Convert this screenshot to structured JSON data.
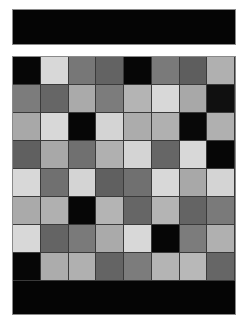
{
  "top_bar": {},
  "board": {
    "rows": 8,
    "cols": 8,
    "cells": [
      [
        "#060606",
        "#d8d8d8",
        "#777777",
        "#636363",
        "#060606",
        "#7a7a7a",
        "#5e5e5e",
        "#b0b0b0"
      ],
      [
        "#7c7c7c",
        "#666666",
        "#aaaaaa",
        "#7c7c7c",
        "#b4b4b4",
        "#d8d8d8",
        "#a8a8a8",
        "#101010"
      ],
      [
        "#a8a8a8",
        "#d8d8d8",
        "#060606",
        "#d4d4d4",
        "#acacac",
        "#b0b0b0",
        "#080808",
        "#b0b0b0"
      ],
      [
        "#606060",
        "#a8a8a8",
        "#707070",
        "#b0b0b0",
        "#d4d4d4",
        "#666666",
        "#d8d8d8",
        "#060606"
      ],
      [
        "#d8d8d8",
        "#707070",
        "#d4d4d4",
        "#606060",
        "#707070",
        "#d8d8d8",
        "#a8a8a8",
        "#d4d4d4"
      ],
      [
        "#aaaaaa",
        "#b0b0b0",
        "#060606",
        "#b4b4b4",
        "#666666",
        "#b4b4b4",
        "#646464",
        "#7a7a7a"
      ],
      [
        "#d8d8d8",
        "#646464",
        "#7a7a7a",
        "#aaaaaa",
        "#d8d8d8",
        "#060606",
        "#7c7c7c",
        "#b0b0b0"
      ],
      [
        "#060606",
        "#acacac",
        "#b0b0b0",
        "#646464",
        "#7c7c7c",
        "#b4b4b4",
        "#b8b8b8",
        "#666666"
      ]
    ]
  },
  "colors": {
    "background": "#ffffff",
    "bar": "#050505"
  }
}
